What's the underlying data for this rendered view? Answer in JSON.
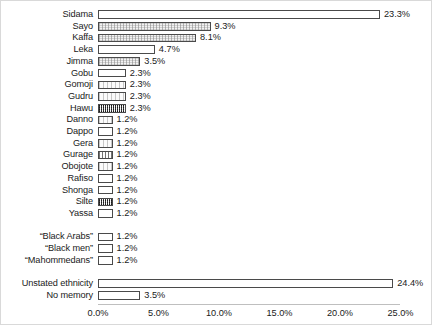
{
  "chart_data": {
    "type": "bar",
    "orientation": "horizontal",
    "title": "",
    "xlabel": "",
    "ylabel": "",
    "xlim": [
      0,
      25
    ],
    "grid": false,
    "legend": "none",
    "xtick_labels": [
      "0.0%",
      "5.0%",
      "10.0%",
      "15.0%",
      "20.0%",
      "25.0%"
    ],
    "xtick_values": [
      0,
      5,
      10,
      15,
      20,
      25
    ],
    "categories": [
      "Sidama",
      "Sayo",
      "Kaffa",
      "Leka",
      "Jimma",
      "Gobu",
      "Gomoji",
      "Gudru",
      "Hawu",
      "Danno",
      "Dappo",
      "Gera",
      "Gurage",
      "Obojote",
      "Rafiso",
      "Shonga",
      "Silte",
      "Yassa",
      "“Black Arabs”",
      "“Black men”",
      "“Mahommedans”",
      "Unstated ethnicity",
      "No memory"
    ],
    "values": [
      23.3,
      9.3,
      8.1,
      4.7,
      3.5,
      2.3,
      2.3,
      2.3,
      2.3,
      1.2,
      1.2,
      1.2,
      1.2,
      1.2,
      1.2,
      1.2,
      1.2,
      1.2,
      1.2,
      1.2,
      1.2,
      24.4,
      3.5
    ],
    "value_labels": [
      "23.3%",
      "9.3%",
      "8.1%",
      "4.7%",
      "3.5%",
      "2.3%",
      "2.3%",
      "2.3%",
      "2.3%",
      "1.2%",
      "1.2%",
      "1.2%",
      "1.2%",
      "1.2%",
      "1.2%",
      "1.2%",
      "1.2%",
      "1.2%",
      "1.2%",
      "1.2%",
      "1.2%",
      "24.4%",
      "3.5%"
    ],
    "bar_fills": [
      "plain",
      "speckle",
      "speckle",
      "plain",
      "speckle",
      "plain",
      "dots",
      "dots",
      "dense",
      "dots",
      "plain",
      "dots",
      "vlines",
      "dots",
      "plain",
      "plain",
      "dense",
      "plain",
      "plain",
      "plain",
      "plain",
      "plain",
      "plain"
    ],
    "row_slots": [
      0,
      1,
      2,
      3,
      4,
      5,
      6,
      7,
      8,
      9,
      10,
      11,
      12,
      13,
      14,
      15,
      16,
      17,
      19,
      20,
      21,
      23,
      24
    ],
    "blank_slots": [
      18,
      22
    ],
    "colors": {
      "bar_outline": "#4a4a4a",
      "bar_face": "#ffffff",
      "text": "#1a1a1a",
      "frame_border": "#d9d9d9",
      "axis_line": "#bfbfbf",
      "background": "#ffffff"
    }
  }
}
